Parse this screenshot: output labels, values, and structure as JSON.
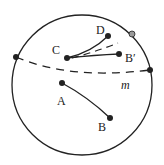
{
  "diagram": {
    "type": "geometry",
    "circle": {
      "cx": 82,
      "cy": 85,
      "r": 70
    },
    "labels": {
      "A": "A",
      "B": "B",
      "C": "C",
      "D": "D",
      "B_prime": "B′",
      "m": "m"
    },
    "points": {
      "A": [
        62,
        83
      ],
      "B": [
        110,
        118
      ],
      "C": [
        67,
        58
      ],
      "D": [
        108,
        36
      ],
      "B_prime": [
        119,
        54
      ],
      "m_left": [
        16,
        57
      ],
      "m_right": [
        150,
        70
      ],
      "boundary_gray": [
        132,
        34
      ]
    },
    "colors": {
      "stroke": "#222222",
      "gray_point": "#9a9a9a"
    }
  }
}
